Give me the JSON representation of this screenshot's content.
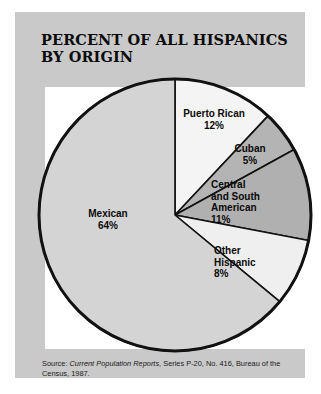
{
  "card": {
    "title": "PERCENT OF ALL HISPANICS\nBY ORIGIN",
    "background_color": "#c9c9c9",
    "panel_color": "#ffffff"
  },
  "source": {
    "prefix": "Source: ",
    "italic_part": "Current Population Reports",
    "suffix": ", Series P-20, No. 416, Bureau of the Census, 1987."
  },
  "labels": {
    "puerto_rican": "Puerto Rican\n12%",
    "cuban": "Cuban\n5%",
    "central_and_south_american": "Central\nand South\nAmerican\n11%",
    "other_hispanic": "Other\nHispanic\n8%",
    "mexican": "Mexican\n64%"
  },
  "chart_data": {
    "type": "pie",
    "title": "PERCENT OF ALL HISPANICS BY ORIGIN",
    "unit": "percent",
    "start_angle_deg": 0,
    "direction": "clockwise",
    "total": 100,
    "categories": [
      "Puerto Rican",
      "Cuban",
      "Central and South American",
      "Other Hispanic",
      "Mexican"
    ],
    "values": [
      12,
      5,
      11,
      8,
      64
    ],
    "slice_colors": [
      "#f4f4f4",
      "#b4b4b4",
      "#b0b0b0",
      "#efefef",
      "#d4d4d4"
    ],
    "stroke_color": "#111111",
    "legend": "none",
    "labels_inline": true,
    "slices": [
      {
        "name": "Puerto Rican",
        "value": 12,
        "label": "Puerto Rican",
        "value_label": "12%",
        "color": "#f4f4f4"
      },
      {
        "name": "Cuban",
        "value": 5,
        "label": "Cuban",
        "value_label": "5%",
        "color": "#b4b4b4"
      },
      {
        "name": "Central and South American",
        "value": 11,
        "label": "Central and South American",
        "value_label": "11%",
        "color": "#b0b0b0"
      },
      {
        "name": "Other Hispanic",
        "value": 8,
        "label": "Other Hispanic",
        "value_label": "8%",
        "color": "#efefef"
      },
      {
        "name": "Mexican",
        "value": 64,
        "label": "Mexican",
        "value_label": "64%",
        "color": "#d4d4d4"
      }
    ],
    "annotations": [
      "Source: Current Population Reports, Series P-20, No. 416, Bureau of the Census, 1987."
    ]
  }
}
